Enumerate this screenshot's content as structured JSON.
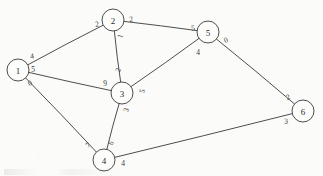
{
  "figure": {
    "kind": "undirected-weighted-graph-sketch",
    "background_color": "#fbfbfa",
    "ink_color": "#3a3a3a"
  },
  "chart_data": {
    "type": "diagram",
    "title": "",
    "nodes": [
      {
        "id": "1",
        "label": "1",
        "x": 18,
        "y": 70,
        "r": 11
      },
      {
        "id": "2",
        "label": "2",
        "x": 113,
        "y": 20,
        "r": 11
      },
      {
        "id": "3",
        "label": "3",
        "x": 122,
        "y": 93,
        "r": 11
      },
      {
        "id": "4",
        "label": "4",
        "x": 104,
        "y": 160,
        "r": 11
      },
      {
        "id": "5",
        "label": "5",
        "x": 208,
        "y": 32,
        "r": 11
      },
      {
        "id": "6",
        "label": "6",
        "x": 303,
        "y": 111,
        "r": 11
      }
    ],
    "edges": [
      {
        "id": "edge-1-2",
        "source": "1",
        "target": "2",
        "source_label": "4",
        "target_label": "2",
        "source_label_x": 32,
        "source_label_y": 56,
        "source_label_rot": -8,
        "target_label_x": 97,
        "target_label_y": 24,
        "target_label_rot": -8
      },
      {
        "id": "edge-1-3",
        "source": "1",
        "target": "3",
        "source_label": "5",
        "target_label": "9",
        "source_label_x": 33,
        "source_label_y": 69,
        "source_label_rot": 0,
        "target_label_x": 105,
        "target_label_y": 83,
        "target_label_rot": 0
      },
      {
        "id": "edge-1-4",
        "source": "1",
        "target": "4",
        "source_label": "0",
        "target_label": "7",
        "source_label_x": 30,
        "source_label_y": 83,
        "source_label_rot": -20,
        "target_label_x": 88,
        "target_label_y": 145,
        "target_label_rot": -42
      },
      {
        "id": "edge-2-3",
        "source": "2",
        "target": "3",
        "source_label": "1",
        "target_label": "2",
        "source_label_x": 120,
        "source_label_y": 36,
        "source_label_rot": -75,
        "target_label_x": 118,
        "target_label_y": 70,
        "target_label_rot": -70
      },
      {
        "id": "edge-2-5",
        "source": "2",
        "target": "5",
        "source_label": "2",
        "target_label": "5",
        "source_label_x": 131,
        "source_label_y": 19,
        "source_label_rot": -7,
        "target_label_x": 193,
        "target_label_y": 28,
        "target_label_rot": -7
      },
      {
        "id": "edge-3-5",
        "source": "3",
        "target": "5",
        "source_label": "5",
        "target_label": "4",
        "source_label_x": 142,
        "source_label_y": 91,
        "source_label_rot": -75,
        "target_label_x": 198,
        "target_label_y": 52,
        "target_label_rot": 0
      },
      {
        "id": "edge-3-4",
        "source": "3",
        "target": "4",
        "source_label": "3",
        "target_label": "6",
        "source_label_x": 126,
        "source_label_y": 110,
        "source_label_rot": -70,
        "target_label_x": 111,
        "target_label_y": 143,
        "target_label_rot": -62
      },
      {
        "id": "edge-4-6",
        "source": "4",
        "target": "6",
        "source_label": "4",
        "target_label": "3",
        "source_label_x": 123,
        "source_label_y": 163,
        "source_label_rot": 0,
        "target_label_x": 286,
        "target_label_y": 121,
        "target_label_rot": -6
      },
      {
        "id": "edge-5-6",
        "source": "5",
        "target": "6",
        "source_label": "0",
        "target_label": "2",
        "source_label_x": 226,
        "source_label_y": 40,
        "source_label_rot": -20,
        "target_label_x": 288,
        "target_label_y": 97,
        "target_label_rot": -22
      }
    ]
  }
}
